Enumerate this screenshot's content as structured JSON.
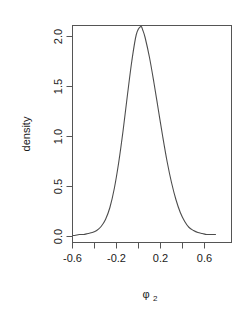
{
  "figure": {
    "background_color": "#ffffff",
    "line_color": "#4d4d4d",
    "axis_color": "#555555",
    "text_color": "#1a1a1a"
  },
  "axes": {
    "x_label_main": "φ",
    "x_label_sub": "2",
    "y_label": "density",
    "x_tick_labels": [
      "-0.6",
      "-0.2",
      "0.2",
      "0.6"
    ],
    "y_tick_labels": [
      "0.0",
      "0.5",
      "1.0",
      "1.5",
      "2.0"
    ]
  },
  "chart_data": {
    "type": "line",
    "title": "",
    "subtitle": "",
    "xlabel": "φ₂",
    "ylabel": "density",
    "xlim": [
      -0.62,
      0.7
    ],
    "ylim": [
      0.0,
      2.18
    ],
    "grid": false,
    "legend": "none",
    "legend_position": "none",
    "x_ticks": [
      -0.6,
      -0.4,
      -0.2,
      0.0,
      0.2,
      0.4,
      0.6
    ],
    "x_ticks_labeled": [
      -0.6,
      -0.2,
      0.2,
      0.6
    ],
    "y_ticks": [
      0.0,
      0.5,
      1.0,
      1.5,
      2.0
    ],
    "annotations": [],
    "series": [
      {
        "name": "density",
        "x": [
          -0.62,
          -0.58,
          -0.54,
          -0.5,
          -0.46,
          -0.42,
          -0.38,
          -0.34,
          -0.3,
          -0.26,
          -0.22,
          -0.18,
          -0.14,
          -0.1,
          -0.06,
          -0.02,
          0.02,
          0.04,
          0.06,
          0.1,
          0.14,
          0.18,
          0.22,
          0.26,
          0.3,
          0.34,
          0.38,
          0.42,
          0.46,
          0.5,
          0.54,
          0.58,
          0.62,
          0.66,
          0.7
        ],
        "y": [
          0.01,
          0.01,
          0.02,
          0.02,
          0.03,
          0.04,
          0.06,
          0.1,
          0.17,
          0.29,
          0.48,
          0.74,
          1.06,
          1.42,
          1.76,
          2.02,
          2.1,
          2.06,
          1.99,
          1.79,
          1.54,
          1.27,
          1.0,
          0.75,
          0.54,
          0.37,
          0.24,
          0.15,
          0.09,
          0.06,
          0.04,
          0.03,
          0.02,
          0.02,
          0.02
        ]
      }
    ]
  }
}
